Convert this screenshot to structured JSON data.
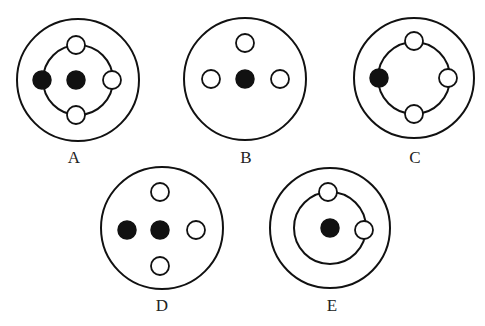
{
  "diagrams": [
    {
      "id": "A",
      "label": "A",
      "center": [
        78,
        80
      ],
      "outer_radius": 61,
      "inner_radius": 35,
      "open_circles": [
        [
          76,
          45
        ],
        [
          112,
          80
        ],
        [
          76,
          115
        ]
      ],
      "filled_circles": [
        [
          42,
          80
        ],
        [
          76,
          80
        ]
      ],
      "label_pos": [
        74,
        163
      ]
    },
    {
      "id": "B",
      "label": "B",
      "center": [
        245,
        79
      ],
      "outer_radius": 61,
      "inner_radius": null,
      "open_circles": [
        [
          245,
          43
        ],
        [
          211,
          79
        ],
        [
          280,
          79
        ]
      ],
      "filled_circles": [
        [
          245,
          79
        ]
      ],
      "label_pos": [
        246,
        163
      ]
    },
    {
      "id": "C",
      "label": "C",
      "center": [
        414,
        78
      ],
      "outer_radius": 60,
      "inner_radius": 36,
      "open_circles": [
        [
          414,
          41
        ],
        [
          448,
          78
        ],
        [
          414,
          114
        ]
      ],
      "filled_circles": [
        [
          379,
          78
        ]
      ],
      "label_pos": [
        415,
        163
      ]
    },
    {
      "id": "D",
      "label": "D",
      "center": [
        162,
        228
      ],
      "outer_radius": 61,
      "inner_radius": null,
      "open_circles": [
        [
          160,
          192
        ],
        [
          196,
          230
        ],
        [
          160,
          266
        ]
      ],
      "filled_circles": [
        [
          127,
          230
        ],
        [
          160,
          230
        ]
      ],
      "label_pos": [
        162,
        311
      ]
    },
    {
      "id": "E",
      "label": "E",
      "center": [
        330,
        228
      ],
      "outer_radius": 60,
      "inner_radius": 36,
      "open_circles": [
        [
          328,
          192
        ],
        [
          364,
          230
        ]
      ],
      "filled_circles": [
        [
          330,
          228
        ]
      ],
      "label_pos": [
        332,
        311
      ]
    }
  ],
  "small_radius": 9,
  "colors": {
    "stroke": "#111111",
    "fill": "#111111",
    "background": "#ffffff"
  }
}
